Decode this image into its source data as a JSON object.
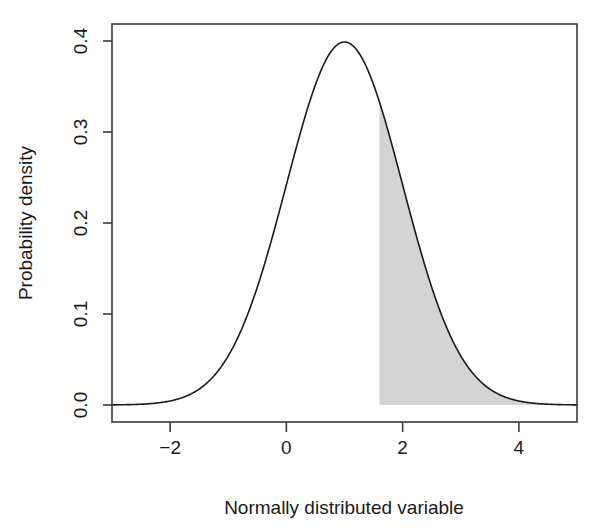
{
  "chart_data": {
    "type": "line",
    "title": "",
    "subtitle": "",
    "xlabel": "Normally distributed variable",
    "ylabel": "Probability density",
    "xlim": [
      -3,
      5
    ],
    "ylim": [
      0,
      0.42
    ],
    "xticks": [
      -2,
      0,
      2,
      4
    ],
    "xtick_labels": [
      "−2",
      "0",
      "2",
      "4"
    ],
    "yticks": [
      0.0,
      0.1,
      0.2,
      0.3,
      0.4
    ],
    "ytick_labels": [
      "0.0",
      "0.1",
      "0.2",
      "0.3",
      "0.4"
    ],
    "grid": false,
    "legend": false,
    "distribution": {
      "name": "normal",
      "mean": 1,
      "sd": 1,
      "peak_density": 0.4
    },
    "series": [
      {
        "name": "Normal density (mean 1, sd 1)",
        "color": "#1a1a1a",
        "x": [
          -3.0,
          -2.8,
          -2.6,
          -2.4,
          -2.2,
          -2.0,
          -1.8,
          -1.6,
          -1.4,
          -1.2,
          -1.0,
          -0.8,
          -0.6,
          -0.4,
          -0.2,
          0.0,
          0.2,
          0.4,
          0.6,
          0.8,
          1.0,
          1.2,
          1.4,
          1.6,
          1.8,
          2.0,
          2.2,
          2.4,
          2.6,
          2.8,
          3.0,
          3.2,
          3.4,
          3.6,
          3.8,
          4.0,
          4.2,
          4.4,
          4.6,
          4.8,
          5.0
        ],
        "values": [
          0.0001,
          0.0002,
          0.0004,
          0.0009,
          0.0018,
          0.0044,
          0.0079,
          0.0136,
          0.0224,
          0.0355,
          0.054,
          0.079,
          0.1109,
          0.1497,
          0.1942,
          0.242,
          0.2897,
          0.3332,
          0.3683,
          0.391,
          0.3989,
          0.391,
          0.3683,
          0.3332,
          0.2897,
          0.242,
          0.1942,
          0.1497,
          0.1109,
          0.079,
          0.054,
          0.0355,
          0.0224,
          0.0136,
          0.0079,
          0.0044,
          0.0018,
          0.0009,
          0.0004,
          0.0002,
          0.0001
        ]
      }
    ],
    "shaded_region": {
      "label": "Upper tail shaded area",
      "from_x": 1.6,
      "to_x": 5.0,
      "fill_color": "#d4d4d4",
      "approx_area": 0.274
    }
  }
}
